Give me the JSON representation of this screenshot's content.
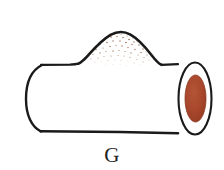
{
  "figure": {
    "label": "G",
    "caption": "G",
    "background_color": "#ffffff",
    "outline_color": "#1a1a1a",
    "body_fill": "#ffffff",
    "end_cap": {
      "name": "tube-end-cap",
      "ring_fill": "#ffffff",
      "ring_stroke": "#1a1a1a",
      "core_fill": "#a8472c",
      "core_stroke": "#8d3a22",
      "core_highlight": "#b55536"
    },
    "bump": {
      "name": "stippled-bump",
      "stipple_color": "#9c6b4a",
      "stipple_color_light": "#c09a7c",
      "apex_y": 33,
      "span_x": [
        78,
        158
      ]
    },
    "geometry": {
      "tube_top_y": 64,
      "tube_bottom_y": 133,
      "tube_left_x": 26,
      "tube_right_x": 196
    }
  }
}
